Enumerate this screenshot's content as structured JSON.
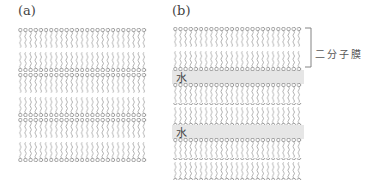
{
  "panels": [
    {
      "label": "(a)",
      "description": "Stacked lipid bilayers without water layers",
      "bilayers": 3
    },
    {
      "label": "(b)",
      "description": "Lipid bilayers separated by water layers",
      "bilayers": 3,
      "water_label": "水",
      "water_layers": 2,
      "bracket_label": "二分子膜"
    }
  ],
  "colors": {
    "lipid": "#8a8a8a",
    "water": "#e6e6e6",
    "text": "#444444"
  },
  "molecules_per_row": 25
}
